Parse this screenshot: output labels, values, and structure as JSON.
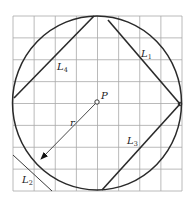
{
  "diagram": {
    "grid": {
      "cols": 8,
      "rows": 8,
      "x0": 13,
      "y0": 16,
      "x1": 182,
      "y1": 191,
      "color": "#a8a8a8"
    },
    "circle": {
      "cx": 97,
      "cy": 103,
      "rx": 84.5,
      "ry": 87,
      "color": "#2a2a2a"
    },
    "center_point": {
      "label": "P",
      "x": 97,
      "y": 102
    },
    "radius": {
      "label": "r",
      "from": [
        97,
        102
      ],
      "to": [
        41,
        159
      ]
    },
    "lines": [
      {
        "name": "L1",
        "label_main": "L",
        "label_sub": "1",
        "x1": 108,
        "y1": 20,
        "x2": 180,
        "y2": 104,
        "label_x": 143,
        "label_y": 56
      },
      {
        "name": "L2",
        "label_main": "L",
        "label_sub": "2",
        "x1": 13,
        "y1": 155,
        "x2": 52,
        "y2": 191,
        "label_x": 23,
        "label_y": 182
      },
      {
        "name": "L3",
        "label_main": "L",
        "label_sub": "3",
        "x1": 180,
        "y1": 104,
        "x2": 102,
        "y2": 190,
        "label_x": 128,
        "label_y": 143
      },
      {
        "name": "L4",
        "label_main": "L",
        "label_sub": "4",
        "x1": 14,
        "y1": 98,
        "x2": 94,
        "y2": 16,
        "label_x": 58,
        "label_y": 69
      }
    ],
    "labels": {
      "P": "P",
      "r": "r",
      "L1_main": "L",
      "L1_sub": "1",
      "L2_main": "L",
      "L2_sub": "2",
      "L3_main": "L",
      "L3_sub": "3",
      "L4_main": "L",
      "L4_sub": "4"
    }
  }
}
